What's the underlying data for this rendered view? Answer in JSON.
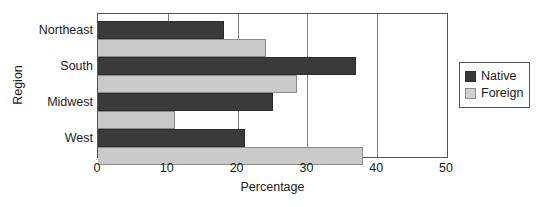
{
  "chart_data": {
    "type": "bar",
    "orientation": "horizontal",
    "title": "",
    "xlabel": "Percentage",
    "ylabel": "Region",
    "categories": [
      "Northeast",
      "South",
      "Midwest",
      "West"
    ],
    "series": [
      {
        "name": "Native",
        "color": "#3a3a3a",
        "values": [
          18,
          37,
          25,
          21
        ]
      },
      {
        "name": "Foreign",
        "color": "#c9c9c9",
        "values": [
          24,
          28.5,
          11,
          38
        ]
      }
    ],
    "xlim": [
      0,
      50
    ],
    "xticks": [
      0,
      10,
      20,
      30,
      40,
      50
    ],
    "xtick_labels": [
      "0",
      "10",
      "20",
      "30",
      "40",
      "50"
    ],
    "gridlines": [
      10,
      20,
      30,
      40
    ],
    "grid": true,
    "legend_position": "right"
  },
  "legend": {
    "entries": [
      {
        "label": "Native"
      },
      {
        "label": "Foreign"
      }
    ]
  }
}
